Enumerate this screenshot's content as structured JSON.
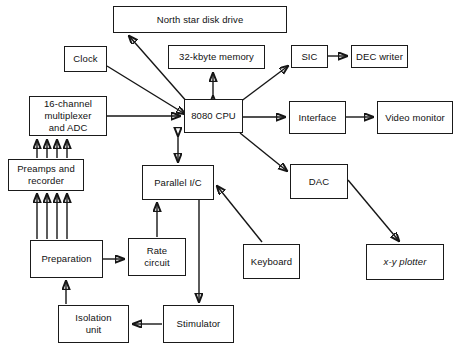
{
  "diagram": {
    "type": "block-diagram",
    "width": 458,
    "height": 347,
    "background_color": "#ffffff",
    "line_color": "#161616",
    "text_color": "#111111",
    "nodes": [
      {
        "id": "disk",
        "label": "North star disk drive",
        "x": 113,
        "y": 6,
        "w": 174,
        "h": 27,
        "italic": false
      },
      {
        "id": "clock",
        "label": "Clock",
        "x": 64,
        "y": 46,
        "w": 43,
        "h": 26,
        "italic": false
      },
      {
        "id": "memory",
        "label": "32-kbyte memory",
        "x": 168,
        "y": 45,
        "w": 97,
        "h": 24,
        "italic": false
      },
      {
        "id": "sic",
        "label": "SIC",
        "x": 291,
        "y": 45,
        "w": 37,
        "h": 23,
        "italic": false
      },
      {
        "id": "decwriter",
        "label": "DEC writer",
        "x": 351,
        "y": 45,
        "w": 57,
        "h": 23,
        "italic": false
      },
      {
        "id": "mux",
        "label": "16-channel\nmultiplexer\nand ADC",
        "x": 29,
        "y": 96,
        "w": 78,
        "h": 40,
        "italic": false
      },
      {
        "id": "cpu",
        "label": "8080 CPU",
        "x": 184,
        "y": 99,
        "w": 59,
        "h": 34,
        "italic": false
      },
      {
        "id": "interface",
        "label": "Interface",
        "x": 289,
        "y": 101,
        "w": 57,
        "h": 33,
        "italic": false
      },
      {
        "id": "monitor",
        "label": "Video monitor",
        "x": 377,
        "y": 101,
        "w": 76,
        "h": 33,
        "italic": false
      },
      {
        "id": "preamps",
        "label": "Preamps and\nrecorder",
        "x": 8,
        "y": 159,
        "w": 76,
        "h": 32,
        "italic": false
      },
      {
        "id": "pio",
        "label": "Parallel I/C",
        "x": 142,
        "y": 165,
        "w": 72,
        "h": 35,
        "italic": false
      },
      {
        "id": "dac",
        "label": "DAC",
        "x": 290,
        "y": 164,
        "w": 58,
        "h": 35,
        "italic": false
      },
      {
        "id": "prep",
        "label": "Preparation",
        "x": 30,
        "y": 240,
        "w": 73,
        "h": 38,
        "italic": false
      },
      {
        "id": "rate",
        "label": "Rate\ncircuit",
        "x": 128,
        "y": 238,
        "w": 58,
        "h": 38,
        "italic": false
      },
      {
        "id": "keyboard",
        "label": "Keyboard",
        "x": 243,
        "y": 244,
        "w": 57,
        "h": 35,
        "italic": false
      },
      {
        "id": "plotter",
        "label": "x-y plotter",
        "x": 366,
        "y": 244,
        "w": 78,
        "h": 36,
        "italic": true
      },
      {
        "id": "isolation",
        "label": "Isolation\nunit",
        "x": 58,
        "y": 305,
        "w": 71,
        "h": 38,
        "italic": false
      },
      {
        "id": "stimulator",
        "label": "Stimulator",
        "x": 163,
        "y": 305,
        "w": 71,
        "h": 38,
        "italic": false
      }
    ],
    "edges": [
      {
        "id": "cpu-disk",
        "from": "8080 CPU",
        "to": "North star disk drive",
        "arrows": "both"
      },
      {
        "id": "cpu-memory",
        "from": "8080 CPU",
        "to": "32-kbyte memory",
        "arrows": "both"
      },
      {
        "id": "cpu-sic",
        "from": "8080 CPU",
        "to": "SIC",
        "arrows": "both"
      },
      {
        "id": "sic-decwriter",
        "from": "SIC",
        "to": "DEC writer",
        "arrows": "forward"
      },
      {
        "id": "clock-cpu",
        "from": "Clock",
        "to": "8080 CPU",
        "arrows": "forward"
      },
      {
        "id": "mux-cpu",
        "from": "16-channel multiplexer and ADC",
        "to": "8080 CPU",
        "arrows": "forward"
      },
      {
        "id": "cpu-interface",
        "from": "8080 CPU",
        "to": "Interface",
        "arrows": "forward"
      },
      {
        "id": "interface-monitor",
        "from": "Interface",
        "to": "Video monitor",
        "arrows": "forward"
      },
      {
        "id": "cpu-dac",
        "from": "8080 CPU",
        "to": "DAC",
        "arrows": "forward"
      },
      {
        "id": "dac-plotter",
        "from": "DAC",
        "to": "x-y plotter",
        "arrows": "forward"
      },
      {
        "id": "cpu-pio",
        "from": "8080 CPU",
        "to": "Parallel I/C",
        "arrows": "both"
      },
      {
        "id": "keyboard-pio",
        "from": "Keyboard",
        "to": "Parallel I/C",
        "arrows": "forward"
      },
      {
        "id": "preamps-mux",
        "from": "Preamps and recorder",
        "to": "16-channel multiplexer and ADC",
        "arrows": "forward",
        "lines": 4
      },
      {
        "id": "prep-preamps",
        "from": "Preparation",
        "to": "Preamps and recorder",
        "arrows": "forward",
        "lines": 4
      },
      {
        "id": "prep-rate",
        "from": "Preparation",
        "to": "Rate circuit",
        "arrows": "forward"
      },
      {
        "id": "rate-pio",
        "from": "Rate circuit",
        "to": "Parallel I/C",
        "arrows": "forward"
      },
      {
        "id": "pio-stimulator",
        "from": "Parallel I/C",
        "to": "Stimulator",
        "arrows": "forward"
      },
      {
        "id": "stimulator-isolation",
        "from": "Stimulator",
        "to": "Isolation unit",
        "arrows": "forward"
      },
      {
        "id": "isolation-prep",
        "from": "Isolation unit",
        "to": "Preparation",
        "arrows": "forward"
      }
    ]
  }
}
